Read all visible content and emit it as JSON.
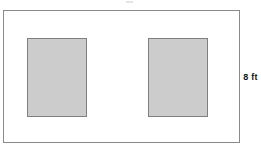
{
  "diagram": {
    "kind": "geometry-figure",
    "canvas": {
      "width_px": 261,
      "height_px": 153,
      "background_color": "#ffffff"
    },
    "outer_rectangle": {
      "name": "room-outline",
      "fill_color": "#ffffff",
      "stroke_color": "#8a8a8a"
    },
    "shaded_rectangles": [
      {
        "name": "left-shaded-rectangle",
        "fill_color": "#cccccc",
        "stroke_color": "#808080"
      },
      {
        "name": "right-shaded-rectangle",
        "fill_color": "#cccccc",
        "stroke_color": "#808080"
      }
    ],
    "labels": {
      "right_side_dimension": "8 ft"
    }
  },
  "chart_data": {
    "type": "diagram",
    "title": "",
    "shapes": [
      {
        "id": "outer-rectangle",
        "role": "boundary",
        "x": 3,
        "y": 10,
        "width": 237,
        "height": 133,
        "fill": "#ffffff",
        "stroke": "#8a8a8a",
        "label": "8 ft",
        "label_side": "right"
      },
      {
        "id": "left-shaded-rectangle",
        "role": "shaded-region",
        "x": 27,
        "y": 48,
        "width": 60,
        "height": 79,
        "fill": "#cccccc",
        "stroke": "#808080",
        "label": ""
      },
      {
        "id": "right-shaded-rectangle",
        "role": "shaded-region",
        "x": 148,
        "y": 48,
        "width": 60,
        "height": 79,
        "fill": "#cccccc",
        "stroke": "#808080",
        "label": ""
      }
    ],
    "annotations": [
      {
        "text": "8 ft",
        "x": 250,
        "y": 78,
        "anchor": "right-of-outer-rectangle",
        "bold": true
      }
    ]
  }
}
